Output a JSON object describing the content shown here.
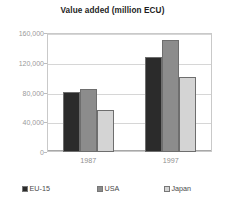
{
  "chart_data": {
    "type": "bar",
    "title": "Value added (million ECU)",
    "xlabel": "",
    "ylabel": "",
    "categories": [
      "1987",
      "1997"
    ],
    "series": [
      {
        "name": "EU-15",
        "color": "#2b2b2b",
        "values": [
          81000,
          128000
        ]
      },
      {
        "name": "USA",
        "color": "#8c8c8c",
        "values": [
          85000,
          150000
        ]
      },
      {
        "name": "Japan",
        "color": "#d4d4d4",
        "values": [
          57000,
          101000
        ]
      }
    ],
    "ylim": [
      0,
      160000
    ],
    "ytick_labels": [
      "0",
      "40,000",
      "80,000",
      "120,000",
      "160,000"
    ],
    "ytick_values": [
      0,
      40000,
      80000,
      120000,
      160000
    ],
    "grid": true,
    "legend_position": "bottom"
  },
  "legend": {
    "items": [
      {
        "label": "EU-15"
      },
      {
        "label": "USA"
      },
      {
        "label": "Japan"
      }
    ]
  }
}
